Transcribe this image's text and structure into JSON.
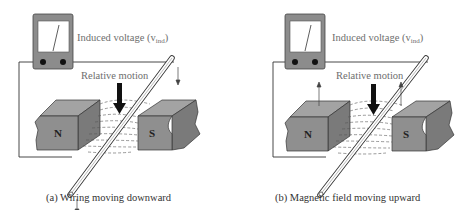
{
  "figure": {
    "panels": [
      {
        "id": "a",
        "meter_label": "Induced voltage (v",
        "meter_label_sub": "ind",
        "meter_label_close": ")",
        "motion_label": "Relative motion",
        "north_pole": "N",
        "south_pole": "S",
        "caption": "(a) Wiring moving downward",
        "moving_part": "wire",
        "motion_direction": "down"
      },
      {
        "id": "b",
        "meter_label": "Induced voltage (v",
        "meter_label_sub": "ind",
        "meter_label_close": ")",
        "motion_label": "Relative motion",
        "north_pole": "N",
        "south_pole": "S",
        "caption": "(b) Magnetic field moving upward",
        "moving_part": "magnets",
        "motion_direction": "up"
      }
    ],
    "colors": {
      "magnet_front": "#8f8f8f",
      "magnet_top": "#a3a3a3",
      "magnet_side": "#7a7a7a",
      "meter_body": "#8c8c8c",
      "line": "#333333",
      "label_text": "#6e6e6e"
    }
  }
}
